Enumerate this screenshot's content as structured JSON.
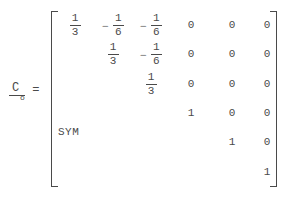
{
  "equation": {
    "lhs": {
      "symbol": "C",
      "subscript": "o",
      "underlined": true
    },
    "relation": "=",
    "annotation": "SYM",
    "bracket_style": "square",
    "matrix": {
      "rows": 6,
      "cols": 6,
      "symmetric": true,
      "cells": [
        [
          {
            "sign": "",
            "type": "fraction",
            "numerator": "1",
            "denominator": "3"
          },
          {
            "sign": "−",
            "type": "fraction",
            "numerator": "1",
            "denominator": "6"
          },
          {
            "sign": "−",
            "type": "fraction",
            "numerator": "1",
            "denominator": "6"
          },
          {
            "sign": "",
            "type": "scalar",
            "value": "0"
          },
          {
            "sign": "",
            "type": "scalar",
            "value": "0"
          },
          {
            "sign": "",
            "type": "scalar",
            "value": "0"
          }
        ],
        [
          {
            "type": "blank"
          },
          {
            "sign": "",
            "type": "fraction",
            "numerator": "1",
            "denominator": "3"
          },
          {
            "sign": "−",
            "type": "fraction",
            "numerator": "1",
            "denominator": "6"
          },
          {
            "sign": "",
            "type": "scalar",
            "value": "0"
          },
          {
            "sign": "",
            "type": "scalar",
            "value": "0"
          },
          {
            "sign": "",
            "type": "scalar",
            "value": "0"
          }
        ],
        [
          {
            "type": "blank"
          },
          {
            "type": "blank"
          },
          {
            "sign": "",
            "type": "fraction",
            "numerator": "1",
            "denominator": "3"
          },
          {
            "sign": "",
            "type": "scalar",
            "value": "0"
          },
          {
            "sign": "",
            "type": "scalar",
            "value": "0"
          },
          {
            "sign": "",
            "type": "scalar",
            "value": "0"
          }
        ],
        [
          {
            "type": "blank"
          },
          {
            "type": "blank"
          },
          {
            "type": "blank"
          },
          {
            "sign": "",
            "type": "scalar",
            "value": "1"
          },
          {
            "sign": "",
            "type": "scalar",
            "value": "0"
          },
          {
            "sign": "",
            "type": "scalar",
            "value": "0"
          }
        ],
        [
          {
            "type": "blank"
          },
          {
            "type": "blank"
          },
          {
            "type": "blank"
          },
          {
            "type": "blank"
          },
          {
            "sign": "",
            "type": "scalar",
            "value": "1"
          },
          {
            "sign": "",
            "type": "scalar",
            "value": "0"
          }
        ],
        [
          {
            "type": "blank"
          },
          {
            "type": "blank"
          },
          {
            "type": "blank"
          },
          {
            "type": "blank"
          },
          {
            "type": "blank"
          },
          {
            "sign": "",
            "type": "scalar",
            "value": "1"
          }
        ]
      ]
    }
  },
  "colors": {
    "ink": "#4a4a4a",
    "background": "#ffffff"
  }
}
